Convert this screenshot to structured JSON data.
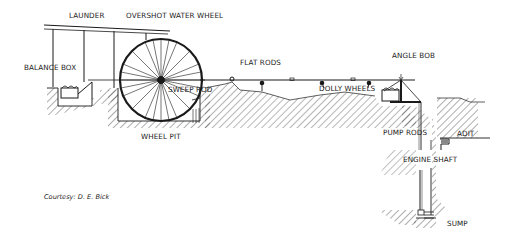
{
  "diagram": {
    "labels": {
      "launder": "LAUNDER",
      "overshot_water_wheel": "OVERSHOT WATER WHEEL",
      "balance_box": "BALANCE BOX",
      "flat_rods": "FLAT RODS",
      "sweep_rod": "SWEEP ROD",
      "dolly_wheels": "DOLLY WHEELS",
      "angle_bob": "ANGLE BOB",
      "wheel_pit": "WHEEL PIT",
      "pump_rods": "PUMP RODS",
      "adit": "ADIT",
      "engine_shaft": "ENGINE SHAFT",
      "sump": "SUMP"
    },
    "credit": "Courtesy: D. E. Bick",
    "colors": {
      "line": "#1a1a1a",
      "background": "#ffffff"
    }
  }
}
